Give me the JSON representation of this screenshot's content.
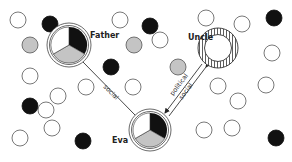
{
  "diagram": {
    "type": "social-network",
    "colors": {
      "white": "#ffffff",
      "gray": "#c4c4c4",
      "black": "#111111",
      "stroke": "#555555"
    },
    "main_nodes": {
      "father": {
        "label": "Father",
        "cx": 69,
        "cy": 45,
        "r": 22,
        "style": "pie"
      },
      "uncle": {
        "label": "Uncle",
        "cx": 218,
        "cy": 48,
        "r": 20,
        "style": "hatched-ring"
      },
      "eva": {
        "label": "Eva",
        "cx": 150,
        "cy": 130,
        "r": 20,
        "style": "pie"
      }
    },
    "edges": [
      {
        "from": "father",
        "to": "eva",
        "label": "social",
        "type": "single-line"
      },
      {
        "from": "uncle",
        "to": "eva",
        "labels": [
          "political",
          "social"
        ],
        "type": "double-line-arrow"
      }
    ],
    "minor_nodes": [
      {
        "cx": 18,
        "cy": 20,
        "fill": "white"
      },
      {
        "cx": 50,
        "cy": 24,
        "fill": "black"
      },
      {
        "cx": 30,
        "cy": 45,
        "fill": "gray"
      },
      {
        "cx": 30,
        "cy": 76,
        "fill": "white"
      },
      {
        "cx": 30,
        "cy": 106,
        "fill": "black"
      },
      {
        "cx": 20,
        "cy": 138,
        "fill": "white"
      },
      {
        "cx": 58,
        "cy": 96,
        "fill": "white"
      },
      {
        "cx": 52,
        "cy": 128,
        "fill": "white"
      },
      {
        "cx": 86,
        "cy": 87,
        "fill": "white"
      },
      {
        "cx": 111,
        "cy": 67,
        "fill": "black"
      },
      {
        "cx": 120,
        "cy": 20,
        "fill": "white"
      },
      {
        "cx": 134,
        "cy": 45,
        "fill": "gray"
      },
      {
        "cx": 150,
        "cy": 26,
        "fill": "black"
      },
      {
        "cx": 160,
        "cy": 40,
        "fill": "white"
      },
      {
        "cx": 178,
        "cy": 67,
        "fill": "gray"
      },
      {
        "cx": 133,
        "cy": 87,
        "fill": "white"
      },
      {
        "cx": 206,
        "cy": 18,
        "fill": "white"
      },
      {
        "cx": 242,
        "cy": 24,
        "fill": "white"
      },
      {
        "cx": 274,
        "cy": 18,
        "fill": "black"
      },
      {
        "cx": 272,
        "cy": 53,
        "fill": "white"
      },
      {
        "cx": 218,
        "cy": 86,
        "fill": "white"
      },
      {
        "cx": 238,
        "cy": 101,
        "fill": "white"
      },
      {
        "cx": 266,
        "cy": 85,
        "fill": "white"
      },
      {
        "cx": 204,
        "cy": 130,
        "fill": "white"
      },
      {
        "cx": 232,
        "cy": 128,
        "fill": "white"
      },
      {
        "cx": 276,
        "cy": 138,
        "fill": "black"
      },
      {
        "cx": 83,
        "cy": 141,
        "fill": "black"
      },
      {
        "cx": 46,
        "cy": 110,
        "fill": "white"
      }
    ]
  }
}
